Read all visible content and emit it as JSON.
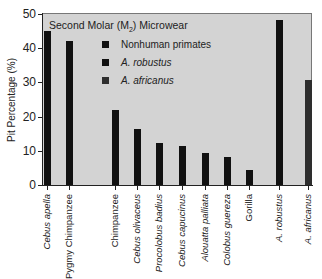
{
  "chart_data": {
    "type": "bar",
    "title": "Second Molar (M2) Microwear",
    "title_parts": {
      "prefix": "Second Molar (M",
      "sub": "2",
      "suffix": ") Microwear"
    },
    "xlabel": "",
    "ylabel": "Pit Percentage (%)",
    "ylim": [
      0,
      50
    ],
    "yticks": [
      0,
      10,
      20,
      30,
      40,
      50
    ],
    "grid": false,
    "legend_position": "upper-left inside",
    "legend": [
      {
        "name": "Nonhuman primates",
        "color": "#111111",
        "italic": false
      },
      {
        "name": "A. robustus",
        "color": "#111111",
        "italic": true
      },
      {
        "name": "A. africanus",
        "color": "#2e2e2e",
        "italic": true
      }
    ],
    "categories": [
      "Cebus apella",
      "Pygmy Chimpanzee",
      "Chimpanzee",
      "Cebus olivaceus",
      "Procolobus badius",
      "Cebus capucinus",
      "Alouatta palliata",
      "Colobus guereza",
      "Gorilla",
      "A. robustus",
      "A. africanus"
    ],
    "category_italic": [
      true,
      false,
      false,
      true,
      true,
      true,
      true,
      true,
      false,
      true,
      true
    ],
    "series": [
      {
        "name": "Nonhuman primates",
        "color": "#111111",
        "values": [
          45,
          42,
          22,
          16.5,
          12.3,
          11.4,
          9.4,
          8.2,
          4.4,
          null,
          null
        ]
      },
      {
        "name": "A. robustus",
        "color": "#111111",
        "values": [
          null,
          null,
          null,
          null,
          null,
          null,
          null,
          null,
          null,
          48.2,
          null
        ]
      },
      {
        "name": "A. africanus",
        "color": "#2e2e2e",
        "values": [
          null,
          null,
          null,
          null,
          null,
          null,
          null,
          null,
          null,
          null,
          30.7
        ]
      }
    ],
    "values": [
      45,
      42,
      22,
      16.5,
      12.3,
      11.4,
      9.4,
      8.2,
      4.4,
      48.2,
      30.7
    ],
    "bar_colors": [
      "#111111",
      "#111111",
      "#111111",
      "#111111",
      "#111111",
      "#111111",
      "#111111",
      "#111111",
      "#111111",
      "#111111",
      "#2e2e2e"
    ],
    "bar_centers_px": [
      47,
      69,
      115,
      137,
      159,
      182,
      205,
      227,
      249,
      279,
      308
    ]
  },
  "colors": {
    "plot_background": "#d3d3d3",
    "axis": "#222222"
  }
}
